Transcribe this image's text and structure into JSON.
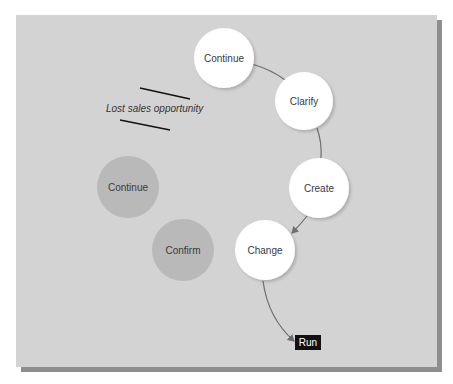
{
  "diagram": {
    "colors": {
      "background": "#d3d3d3",
      "shadow": "#8e8e8e",
      "active_node": "#ffffff",
      "inactive_node": "#b9b9b9",
      "connector": "#6e6e6e",
      "run_box": "#111111"
    },
    "active_nodes": [
      {
        "id": "continue",
        "label": "Continue"
      },
      {
        "id": "clarify",
        "label": "Clarify"
      },
      {
        "id": "create",
        "label": "Create"
      },
      {
        "id": "change",
        "label": "Change"
      }
    ],
    "inactive_nodes": [
      {
        "id": "continue-lost",
        "label": "Continue"
      },
      {
        "id": "confirm",
        "label": "Confirm"
      }
    ],
    "annotation": "Lost sales opportunity",
    "terminal": {
      "label": "Run"
    }
  }
}
